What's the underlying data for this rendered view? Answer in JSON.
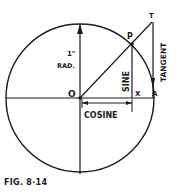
{
  "figure": {
    "caption": "FIG. 8·14",
    "labels": {
      "origin": "O",
      "point_p": "P",
      "point_t": "T",
      "point_x": "X",
      "point_a": "A",
      "radius": "1\"",
      "radius_unit": "RAD.",
      "sine": "SINE",
      "cosine": "COSINE",
      "tangent": "TANGENT"
    },
    "colors": {
      "line": "#1a1a1a",
      "background": "#ffffff"
    }
  }
}
